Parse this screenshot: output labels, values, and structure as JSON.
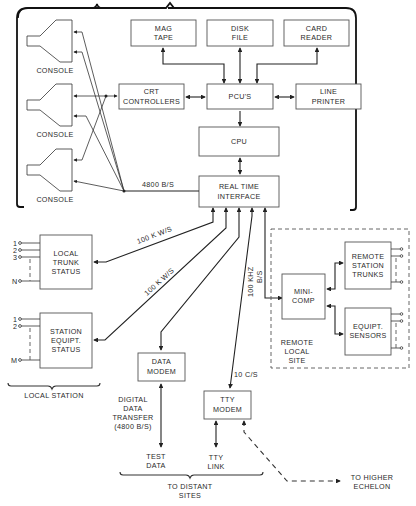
{
  "diagram": {
    "type": "block-diagram",
    "central_site": {
      "boxes": {
        "mag_tape": [
          "MAG",
          "TAPE"
        ],
        "disk_file": [
          "DISK",
          "FILE"
        ],
        "card_reader": [
          "CARD",
          "READER"
        ],
        "crt_controllers": [
          "CRT",
          "CONTROLLERS"
        ],
        "pcus": [
          "PCU'S"
        ],
        "line_printer": [
          "LINE",
          "PRINTER"
        ],
        "cpu": [
          "CPU"
        ],
        "real_time_interface": [
          "REAL TIME",
          "INTERFACE"
        ]
      },
      "consoles": [
        "CONSOLE",
        "CONSOLE",
        "CONSOLE"
      ],
      "console_link_rate": "4800 B/S"
    },
    "local_station": {
      "label": "LOCAL STATION",
      "local_trunk_status": [
        "LOCAL",
        "TRUNK",
        "STATUS"
      ],
      "station_equipt_status": [
        "STATION",
        "EQUIPT.",
        "STATUS"
      ],
      "trunk_inputs": [
        "1",
        "2",
        "3",
        "N"
      ],
      "equipt_inputs": [
        "1",
        "2",
        "M"
      ],
      "trunk_link_rate": "100 K W/S",
      "equipt_link_rate": "100 K W/S"
    },
    "remote_local_site": {
      "label": [
        "REMOTE",
        "LOCAL",
        "SITE"
      ],
      "mini_comp": [
        "MINI-",
        "COMP"
      ],
      "remote_station_trunks": [
        "REMOTE",
        "STATION",
        "TRUNKS"
      ],
      "equipt_sensors": [
        "EQUIPT.",
        "SENSORS"
      ],
      "link_rate": [
        "100 KHZ",
        "B/S"
      ]
    },
    "distant": {
      "data_modem": [
        "DATA",
        "MODEM"
      ],
      "tty_modem": [
        "TTY",
        "MODEM"
      ],
      "tty_rate": "10 C/S",
      "digital_data_transfer": [
        "DIGITAL",
        "DATA",
        "TRANSFER",
        "(4800 B/S)"
      ],
      "test_data": [
        "TEST",
        "DATA"
      ],
      "tty_link": [
        "TTY",
        "LINK"
      ],
      "to_distant_sites": [
        "TO DISTANT",
        "SITES"
      ],
      "to_higher_echelon": [
        "TO HIGHER",
        "ECHELON"
      ]
    }
  }
}
